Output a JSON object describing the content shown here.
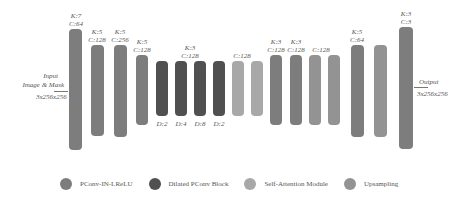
{
  "input": {
    "line1": "Input",
    "line2": "Image & Mask",
    "dims": "3x256x256"
  },
  "output": {
    "line1": "Output",
    "dims": "3x256x256"
  },
  "blocks": [
    {
      "type": "pconv",
      "k": "K:7",
      "c": "C:64"
    },
    {
      "type": "pconv",
      "k": "K:5",
      "c": "C:128"
    },
    {
      "type": "pconv",
      "k": "K:5",
      "c": "C:256"
    },
    {
      "type": "pconv",
      "k": "K:5",
      "c": "C:128"
    },
    {
      "type": "dilated",
      "d": "D:2"
    },
    {
      "type": "dilated",
      "d": "D:4",
      "k": "K:3",
      "c": "C:128"
    },
    {
      "type": "dilated",
      "d": "D:8"
    },
    {
      "type": "dilated",
      "d": "D:2"
    },
    {
      "type": "attention",
      "c": "C:128"
    },
    {
      "type": "attention"
    },
    {
      "type": "pconv",
      "k": "K:3",
      "c": "C:128"
    },
    {
      "type": "pconv",
      "k": "K:3",
      "c": "C:128"
    },
    {
      "type": "upsampling",
      "c": "C:128"
    },
    {
      "type": "pconv",
      "k": "K:5",
      "c": "C:64"
    },
    {
      "type": "upsampling"
    },
    {
      "type": "pconv",
      "k": "K:3",
      "c": "C:3"
    }
  ],
  "labels": {
    "b1": "K:7\nC:64",
    "b2": "K:5\nC:128",
    "b3": "K:5\nC:256",
    "b4": "K:5\nC:128",
    "b6": "K:3\nC:128",
    "b9": "C:128",
    "b11": "K:3\nC:128",
    "b12": "K:3\nC:128",
    "b13": "C:128",
    "b14": "K:5\nC:64",
    "b16": "K:3\nC:3",
    "d5": "D:2",
    "d6": "D:4",
    "d7": "D:8",
    "d8": "D:2"
  },
  "legend": [
    {
      "label": "PConv-IN-LReLU",
      "color": "#7d7d7d"
    },
    {
      "label": "Dilated PConv Block",
      "color": "#505050"
    },
    {
      "label": "Self-Attention Module",
      "color": "#a8a8a8"
    },
    {
      "label": "Upsampling",
      "color": "#939393"
    }
  ]
}
